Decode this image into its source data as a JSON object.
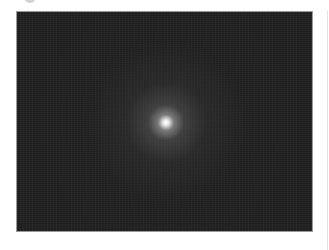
{
  "image": {
    "alt": "Dark noisy astronomical photograph with a single bright diffuse point source near the center",
    "subject": "bright glowing point on dark noisy background",
    "colors": {
      "background": "#1c1c1c",
      "glow_center": "#ffffff",
      "border": "#9a9a9a",
      "page": "#ffffff"
    }
  },
  "decor": {
    "top_icon": "partial-circle-icon",
    "right_rule": "vertical-divider"
  }
}
